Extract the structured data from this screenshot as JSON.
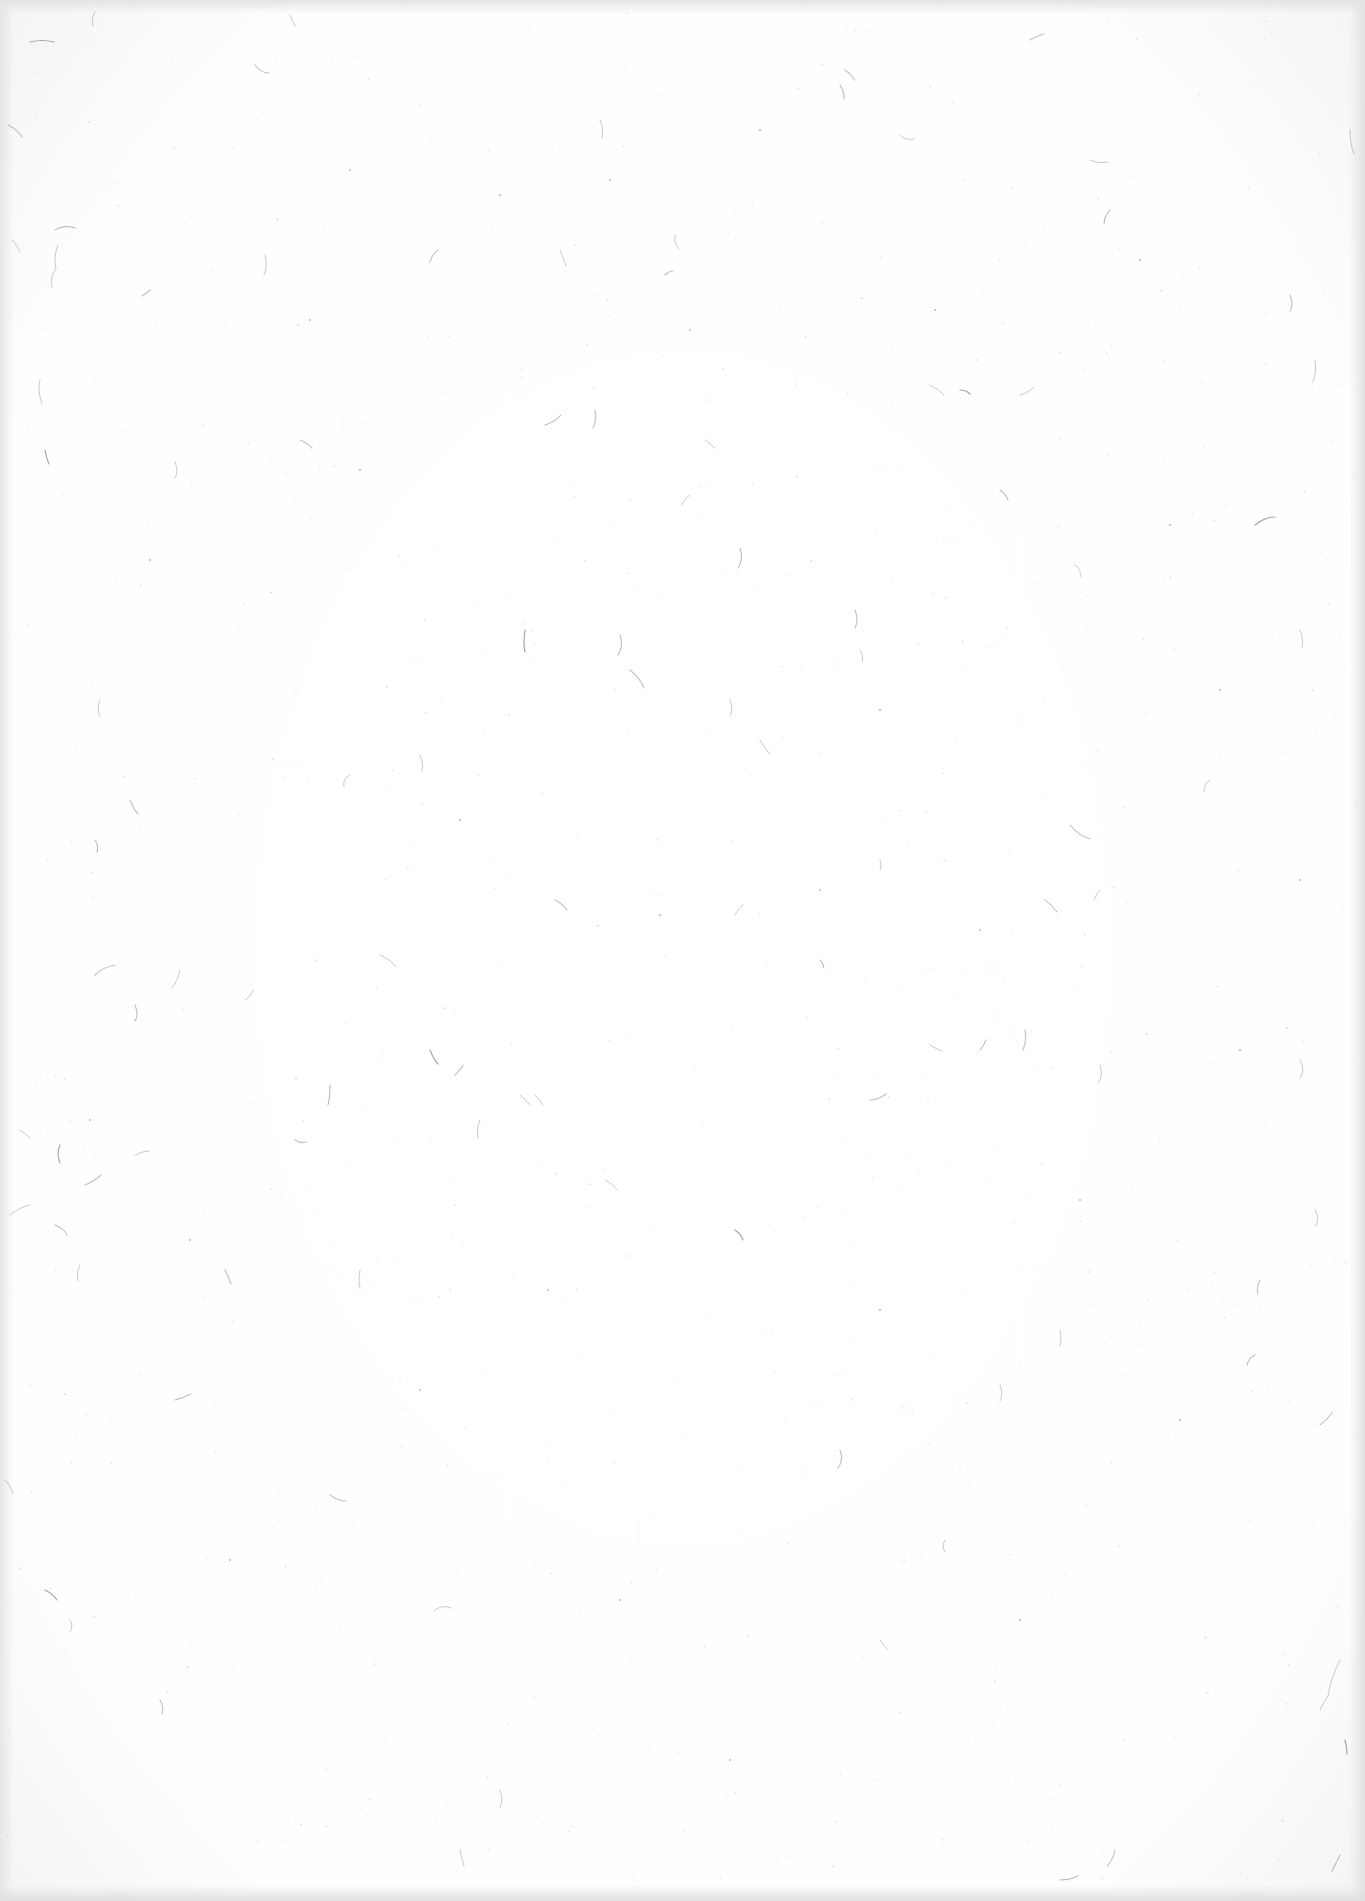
{
  "page": {
    "background_color": "#fefefe",
    "edge_color": "#e4e4e4",
    "fiber_color": "#8a8a8a",
    "speck_color": "#9a9a9a"
  },
  "fibers": [
    [
      30,
      42,
      "q 12 -3 24 0"
    ],
    [
      95,
      12,
      "q -4 6 -2 14"
    ],
    [
      290,
      15,
      "q 3 8 6 12"
    ],
    [
      255,
      65,
      "q 6 8 14 8"
    ],
    [
      55,
      230,
      "q 10 -6 20 -2"
    ],
    [
      58,
      245,
      "q -5 12 -2 24 q -6 6 -4 18"
    ],
    [
      150,
      290,
      "q -4 4 -8 6"
    ],
    [
      265,
      255,
      "q 3 10 -1 20"
    ],
    [
      438,
      250,
      "q -6 4 -8 12"
    ],
    [
      8,
      125,
      "q 10 5 14 12"
    ],
    [
      12,
      240,
      "q 6 6 8 12"
    ],
    [
      40,
      380,
      "q -3 10 2 24"
    ],
    [
      45,
      450,
      "q 2 10 4 14"
    ],
    [
      175,
      462,
      "q 4 10 0 16"
    ],
    [
      600,
      120,
      "q 4 10 2 18"
    ],
    [
      845,
      70,
      "q 6 4 10 10"
    ],
    [
      840,
      85,
      "q 5 8 4 14"
    ],
    [
      900,
      135,
      "q 6 6 14 4"
    ],
    [
      1030,
      40,
      "q 6 -4 14 -6"
    ],
    [
      1090,
      160,
      "q 8 4 18 2"
    ],
    [
      1110,
      210,
      "q -6 6 -6 14"
    ],
    [
      1290,
      295,
      "q 4 10 0 16"
    ],
    [
      1315,
      360,
      "q 2 12 -2 22"
    ],
    [
      930,
      385,
      "q 8 4 14 10"
    ],
    [
      960,
      390,
      "q 6 0 10 4"
    ],
    [
      675,
      235,
      "q -2 8 4 14"
    ],
    [
      705,
      440,
      "q 6 4 10 8"
    ],
    [
      665,
      275,
      "q 4 -4 8 -4"
    ],
    [
      545,
      425,
      "q 10 -3 16 -10"
    ],
    [
      560,
      250,
      "q 4 10 6 16"
    ],
    [
      595,
      410,
      "q 2 10 -2 18"
    ],
    [
      690,
      495,
      "q -6 4 -8 10"
    ],
    [
      740,
      548,
      "q 4 12 -2 20"
    ],
    [
      1000,
      490,
      "q 6 4 8 10"
    ],
    [
      1020,
      395,
      "q 8 -2 14 -8"
    ],
    [
      1075,
      565,
      "q 6 4 6 12"
    ],
    [
      1255,
      525,
      "q 10 -8 20 -8"
    ],
    [
      1300,
      630,
      "q 4 10 2 18"
    ],
    [
      1210,
      780,
      "q -6 4 -6 12"
    ],
    [
      1070,
      825,
      "q 8 10 20 14"
    ],
    [
      1045,
      900,
      "q 6 4 12 12"
    ],
    [
      1100,
      890,
      "q -4 4 -6 10"
    ],
    [
      855,
      610,
      "q 4 10 0 18"
    ],
    [
      860,
      650,
      "q 4 6 2 12"
    ],
    [
      620,
      635,
      "q 4 12 -2 20"
    ],
    [
      630,
      670,
      "q 10 8 14 18"
    ],
    [
      730,
      700,
      "q 4 10 0 16"
    ],
    [
      760,
      740,
      "q 6 10 10 14"
    ],
    [
      525,
      630,
      "q -2 14 0 22"
    ],
    [
      350,
      775,
      "q -8 4 -6 12"
    ],
    [
      100,
      700,
      "q -4 10 0 16"
    ],
    [
      130,
      800,
      "q 4 10 8 14"
    ],
    [
      95,
      840,
      "q 4 6 2 12"
    ],
    [
      420,
      755,
      "q 4 10 2 16"
    ],
    [
      555,
      900,
      "q 8 4 12 10"
    ],
    [
      735,
      915,
      "q 4 -8 8 -10"
    ],
    [
      820,
      960,
      "q 4 4 4 8"
    ],
    [
      95,
      975,
      "q 8 -8 20 -10"
    ],
    [
      380,
      955,
      "q 10 4 16 12"
    ],
    [
      245,
      1000,
      "q 6 -4 8 -10"
    ],
    [
      430,
      1050,
      "q 4 10 8 14"
    ],
    [
      535,
      1095,
      "q 4 4 8 10"
    ],
    [
      480,
      1120,
      "q -4 10 -2 18"
    ],
    [
      455,
      1075,
      "q 6 -6 8 -10"
    ],
    [
      330,
      1085,
      "q 0 12 -2 20"
    ],
    [
      520,
      1095,
      "q 6 6 10 10"
    ],
    [
      870,
      1100,
      "q 8 0 16 -6"
    ],
    [
      930,
      1045,
      "q 6 4 12 6"
    ],
    [
      980,
      1050,
      "q 4 -4 6 -10"
    ],
    [
      1025,
      1030,
      "q 2 10 -2 20"
    ],
    [
      1100,
      1065,
      "q 4 12 -2 18"
    ],
    [
      1300,
      1060,
      "q 6 10 0 18"
    ],
    [
      60,
      1145,
      "q -4 8 0 18"
    ],
    [
      20,
      1130,
      "q 6 4 10 8"
    ],
    [
      10,
      1215,
      "q 10 -8 20 -10"
    ],
    [
      85,
      1185,
      "q 10 -4 16 -10"
    ],
    [
      55,
      1225,
      "q 10 4 12 10"
    ],
    [
      80,
      1265,
      "q -4 8 -2 16"
    ],
    [
      225,
      1270,
      "q 4 8 6 14"
    ],
    [
      135,
      1155,
      "q 8 -4 14 -4"
    ],
    [
      175,
      1400,
      "q 8 -2 16 -6"
    ],
    [
      295,
      1140,
      "q 6 4 12 2"
    ],
    [
      360,
      1270,
      "q -2 10 0 18"
    ],
    [
      605,
      1180,
      "q 8 4 12 10"
    ],
    [
      735,
      1230,
      "q 6 4 8 10"
    ],
    [
      1000,
      1385,
      "q 4 10 0 16"
    ],
    [
      1060,
      1330,
      "q 2 10 0 16"
    ],
    [
      1260,
      1280,
      "q -4 8 -2 14"
    ],
    [
      1255,
      1355,
      "q -6 2 -8 10"
    ],
    [
      1315,
      1210,
      "q 6 10 0 16"
    ],
    [
      840,
      1450,
      "q 4 10 -2 18"
    ],
    [
      945,
      1540,
      "q -4 6 0 12"
    ],
    [
      1320,
      1425,
      "q 8 -6 12 -12"
    ],
    [
      330,
      1495,
      "q 8 6 16 6"
    ],
    [
      435,
      1610,
      "q 8 -6 16 -2"
    ],
    [
      70,
      1620,
      "q 4 6 0 12"
    ],
    [
      45,
      1590,
      "q 8 4 12 10"
    ],
    [
      1340,
      1660,
      "q -10 20 -12 36 q -4 6 -8 14"
    ],
    [
      880,
      1640,
      "q 4 6 8 10"
    ],
    [
      1115,
      1850,
      "q -2 10 -8 16"
    ],
    [
      1340,
      1855,
      "q -4 8 -8 16"
    ],
    [
      460,
      1850,
      "q 2 10 4 16"
    ],
    [
      160,
      1700,
      "q 4 6 2 14"
    ],
    [
      500,
      1790,
      "q 4 10 0 18"
    ],
    [
      1060,
      1880,
      "q 10 0 18 -4"
    ],
    [
      300,
      440,
      "q 6 2 12 8"
    ],
    [
      880,
      860,
      "q 2 6 0 10"
    ],
    [
      1350,
      130,
      "q 0 14 4 24"
    ],
    [
      1345,
      1740,
      "q 2 8 2 14"
    ],
    [
      5,
      1480,
      "q 6 6 8 14"
    ],
    [
      180,
      970,
      "q -2 10 -8 18"
    ],
    [
      135,
      1005,
      "q 4 10 0 16"
    ]
  ],
  "specks": [
    [
      350,
      170
    ],
    [
      610,
      180
    ],
    [
      500,
      195
    ],
    [
      935,
      310
    ],
    [
      1170,
      525
    ],
    [
      880,
      710
    ],
    [
      660,
      915
    ],
    [
      548,
      1290
    ],
    [
      190,
      1240
    ],
    [
      820,
      890
    ],
    [
      1240,
      1050
    ],
    [
      360,
      470
    ],
    [
      760,
      130
    ],
    [
      1080,
      1200
    ],
    [
      620,
      1600
    ],
    [
      230,
      1560
    ],
    [
      1180,
      1420
    ],
    [
      420,
      1390
    ],
    [
      980,
      930
    ],
    [
      690,
      330
    ],
    [
      1300,
      880
    ],
    [
      90,
      1120
    ],
    [
      880,
      1310
    ],
    [
      1140,
      260
    ],
    [
      310,
      320
    ],
    [
      1220,
      690
    ],
    [
      460,
      820
    ],
    [
      730,
      1760
    ],
    [
      1020,
      1620
    ],
    [
      150,
      560
    ]
  ]
}
